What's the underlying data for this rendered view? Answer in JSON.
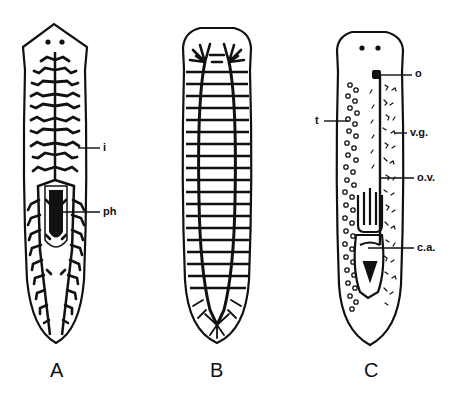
{
  "figure": {
    "panels": [
      {
        "id": "A",
        "label": "A",
        "subject": "planarian digestive system",
        "annotations": [
          {
            "key": "i",
            "text": "i"
          },
          {
            "key": "ph",
            "text": "ph"
          }
        ]
      },
      {
        "id": "B",
        "label": "B",
        "subject": "planarian nervous system (ladder-like)"
      },
      {
        "id": "C",
        "label": "C",
        "subject": "planarian reproductive system",
        "annotations": [
          {
            "key": "o",
            "text": "o"
          },
          {
            "key": "vg",
            "text": "v.g."
          },
          {
            "key": "ov",
            "text": "o.v."
          },
          {
            "key": "ca",
            "text": "c.a."
          },
          {
            "key": "t",
            "text": "t"
          }
        ]
      }
    ],
    "colors": {
      "ink": "#111111",
      "background": "#ffffff"
    }
  },
  "labels": {
    "A": "A",
    "B": "B",
    "C": "C",
    "a_i": "i",
    "a_ph": "ph",
    "c_o": "o",
    "c_vg": "v.g.",
    "c_ov": "o.v.",
    "c_ca": "c.a.",
    "c_t": "t"
  }
}
